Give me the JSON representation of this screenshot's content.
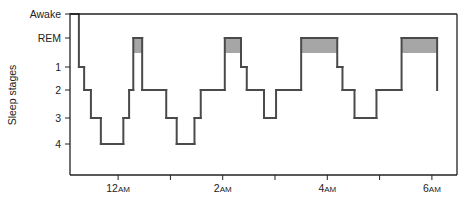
{
  "chart_data": {
    "type": "line",
    "subtype": "hypnogram-step",
    "title": "",
    "xlabel": "",
    "ylabel": "Sleep stages",
    "y_categories": [
      "Awake",
      "REM",
      "1",
      "2",
      "3",
      "4"
    ],
    "x_unit": "hours relative to 12AM",
    "xlim": [
      -0.92,
      6.48
    ],
    "x_ticks": [
      {
        "value": 0,
        "label_main": "12",
        "label_suffix": "AM"
      },
      {
        "value": 1,
        "label_main": "",
        "label_suffix": ""
      },
      {
        "value": 2,
        "label_main": "2",
        "label_suffix": "AM"
      },
      {
        "value": 3,
        "label_main": "",
        "label_suffix": ""
      },
      {
        "value": 4,
        "label_main": "4",
        "label_suffix": "AM"
      },
      {
        "value": 5,
        "label_main": "",
        "label_suffix": ""
      },
      {
        "value": 6,
        "label_main": "6",
        "label_suffix": "AM"
      }
    ],
    "steps": [
      {
        "t": -0.92,
        "stage": "Awake"
      },
      {
        "t": -0.75,
        "stage": "1"
      },
      {
        "t": -0.65,
        "stage": "2"
      },
      {
        "t": -0.52,
        "stage": "3"
      },
      {
        "t": -0.33,
        "stage": "4"
      },
      {
        "t": 0.1,
        "stage": "3"
      },
      {
        "t": 0.21,
        "stage": "2"
      },
      {
        "t": 0.29,
        "stage": "REM"
      },
      {
        "t": 0.46,
        "stage": "2"
      },
      {
        "t": 0.92,
        "stage": "3"
      },
      {
        "t": 1.12,
        "stage": "4"
      },
      {
        "t": 1.46,
        "stage": "3"
      },
      {
        "t": 1.58,
        "stage": "2"
      },
      {
        "t": 2.04,
        "stage": "REM"
      },
      {
        "t": 2.35,
        "stage": "1"
      },
      {
        "t": 2.46,
        "stage": "2"
      },
      {
        "t": 2.79,
        "stage": "3"
      },
      {
        "t": 3.02,
        "stage": "2"
      },
      {
        "t": 3.5,
        "stage": "REM"
      },
      {
        "t": 4.19,
        "stage": "1"
      },
      {
        "t": 4.29,
        "stage": "2"
      },
      {
        "t": 4.52,
        "stage": "3"
      },
      {
        "t": 4.94,
        "stage": "2"
      },
      {
        "t": 5.42,
        "stage": "REM"
      },
      {
        "t": 6.1,
        "stage": "2"
      }
    ],
    "end_t": 6.1,
    "rem_shading_color": "#a6a6a6",
    "line_color": "#4a4a4a",
    "grid": false,
    "legend": "none"
  }
}
